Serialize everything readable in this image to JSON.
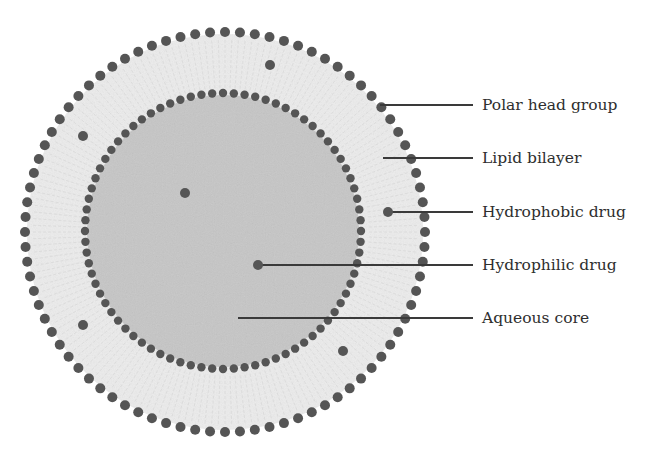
{
  "diagram": {
    "colors": {
      "background": "#ffffff",
      "bilayer_fill": "#ececec",
      "core_fill": "#c6c6c6",
      "dot": "#555555",
      "line": "#3a3a3a",
      "text": "#2e2e2e"
    },
    "outer_ring": {
      "cx": 225,
      "cy": 232,
      "r": 200,
      "dot_radius": 5,
      "count": 84
    },
    "inner_ring": {
      "cx": 223,
      "cy": 231,
      "r": 138,
      "dot_radius": 4.2,
      "count": 80
    },
    "core": {
      "cx": 223,
      "cy": 231,
      "r": 136
    },
    "drug_dots": [
      {
        "type": "hydrophobic",
        "x": 270,
        "y": 65
      },
      {
        "type": "hydrophobic",
        "x": 83,
        "y": 136
      },
      {
        "type": "hydrophilic",
        "x": 185,
        "y": 193
      },
      {
        "type": "hydrophobic",
        "x": 388,
        "y": 212
      },
      {
        "type": "hydrophilic",
        "x": 258,
        "y": 265
      },
      {
        "type": "hydrophobic",
        "x": 83,
        "y": 325
      },
      {
        "type": "hydrophobic",
        "x": 343,
        "y": 351
      }
    ],
    "callouts": [
      {
        "label": "Polar head group",
        "x1": 380,
        "y": 105,
        "x2": 473
      },
      {
        "label": "Lipid bilayer",
        "x1": 383,
        "y": 158,
        "x2": 473
      },
      {
        "label": "Hydrophobic drug",
        "x1": 388,
        "y": 212,
        "x2": 473
      },
      {
        "label": "Hydrophilic drug",
        "x1": 258,
        "y": 265,
        "x2": 473
      },
      {
        "label": "Aqueous core",
        "x1": 238,
        "y": 318,
        "x2": 473
      }
    ]
  }
}
